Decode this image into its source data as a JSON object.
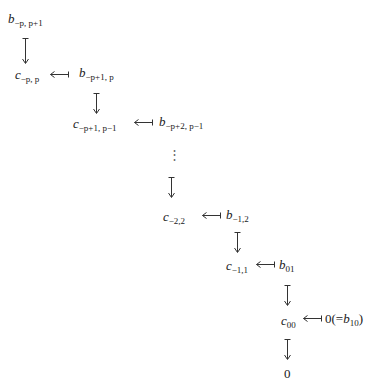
{
  "diagram": {
    "type": "staircase-exact-sequence",
    "nodes": [
      {
        "id": "b_-p_p+1",
        "letter": "b",
        "sub": "−p, p+1"
      },
      {
        "id": "c_-p_p",
        "letter": "c",
        "sub": "−p, p"
      },
      {
        "id": "b_-p+1_p",
        "letter": "b",
        "sub": "−p+1, p"
      },
      {
        "id": "c_-p+1_p-1",
        "letter": "c",
        "sub": "−p+1, p−1"
      },
      {
        "id": "b_-p+2_p-1",
        "letter": "b",
        "sub": "−p+2, p−1"
      },
      {
        "id": "c_-2_2",
        "letter": "c",
        "sub": "−2,2"
      },
      {
        "id": "b_-1_2",
        "letter": "b",
        "sub": "−1,2"
      },
      {
        "id": "c_-1_1",
        "letter": "c",
        "sub": "−1,1"
      },
      {
        "id": "b_01",
        "letter": "b",
        "sub": "01"
      },
      {
        "id": "c_00",
        "letter": "c",
        "sub": "00"
      },
      {
        "id": "zero_eq_b10",
        "prefix": "0(=",
        "letter": "b",
        "sub": "10",
        "suffix": ")"
      },
      {
        "id": "zero_final",
        "prefix": "0"
      }
    ],
    "vertical_dots": "⋮",
    "edges": [
      {
        "from": "b_-p_p+1",
        "to": "c_-p_p",
        "style": "maps-to-down"
      },
      {
        "from": "b_-p+1_p",
        "to": "c_-p_p",
        "style": "maps-to-left"
      },
      {
        "from": "b_-p+1_p",
        "to": "c_-p+1_p-1",
        "style": "maps-to-down"
      },
      {
        "from": "b_-p+2_p-1",
        "to": "c_-p+1_p-1",
        "style": "maps-to-left"
      },
      {
        "from": "dots",
        "to": "c_-2_2",
        "style": "maps-to-down"
      },
      {
        "from": "b_-1_2",
        "to": "c_-2_2",
        "style": "maps-to-left"
      },
      {
        "from": "b_-1_2",
        "to": "c_-1_1",
        "style": "maps-to-down"
      },
      {
        "from": "b_01",
        "to": "c_-1_1",
        "style": "maps-to-left"
      },
      {
        "from": "b_01",
        "to": "c_00",
        "style": "maps-to-down"
      },
      {
        "from": "zero_eq_b10",
        "to": "c_00",
        "style": "maps-to-left"
      },
      {
        "from": "c_00",
        "to": "zero_final",
        "style": "maps-to-down"
      }
    ]
  }
}
